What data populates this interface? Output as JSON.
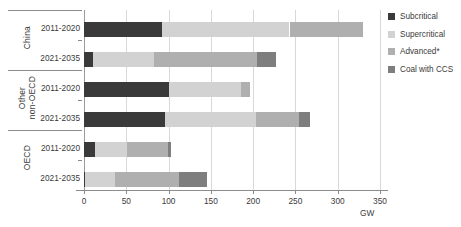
{
  "chart_data": {
    "type": "bar",
    "orientation": "horizontal",
    "stacked": true,
    "title": "",
    "xlabel": "GW",
    "ylabel": "",
    "xlim": [
      0,
      350
    ],
    "xticks": [
      0,
      50,
      100,
      150,
      200,
      250,
      300,
      350
    ],
    "grid": true,
    "legend_position": "right",
    "groups": [
      "China",
      "Other\nnon-OECD",
      "OECD"
    ],
    "categories": [
      "China 2011-2020",
      "China 2021-2035",
      "Other non-OECD 2011-2020",
      "Other non-OECD 2021-2035",
      "OECD 2011-2020",
      "OECD 2021-2035"
    ],
    "series": [
      {
        "name": "Subcritical",
        "color": "#3a3a3a",
        "values": [
          92,
          11,
          101,
          96,
          13,
          1
        ]
      },
      {
        "name": "Supercritical",
        "color": "#d2d2d2",
        "values": [
          151,
          72,
          85,
          107,
          38,
          36
        ]
      },
      {
        "name": "Advanced*",
        "color": "#afafaf",
        "values": [
          87,
          122,
          10,
          51,
          48,
          75
        ]
      },
      {
        "name": "Coal with CCS",
        "color": "#7e7e7e",
        "values": [
          0,
          22,
          0,
          13,
          4,
          34
        ]
      }
    ],
    "totals": [
      330,
      227,
      196,
      267,
      103,
      146
    ]
  },
  "axis": {
    "unit_label": "GW",
    "tick_labels": [
      "0",
      "50",
      "100",
      "150",
      "200",
      "250",
      "300",
      "350"
    ]
  },
  "groups": [
    {
      "label": "China"
    },
    {
      "label": "Other\nnon-OECD"
    },
    {
      "label": "OECD"
    }
  ],
  "rows": [
    {
      "period": "2011-2020"
    },
    {
      "period": "2021-2035"
    },
    {
      "period": "2011-2020"
    },
    {
      "period": "2021-2035"
    },
    {
      "period": "2011-2020"
    },
    {
      "period": "2021-2035"
    }
  ],
  "legend": {
    "items": [
      {
        "label": "Subcritical",
        "color": "#3a3a3a"
      },
      {
        "label": "Supercritical",
        "color": "#d2d2d2"
      },
      {
        "label": "Advanced*",
        "color": "#afafaf"
      },
      {
        "label": "Coal with CCS",
        "color": "#7e7e7e"
      }
    ]
  }
}
